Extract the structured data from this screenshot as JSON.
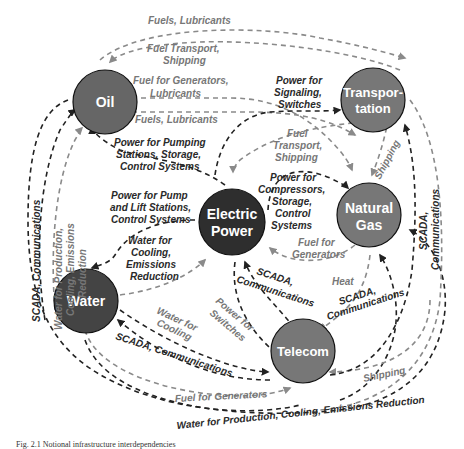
{
  "nodes": {
    "oil": {
      "label": "Oil",
      "color": "#666666"
    },
    "transportation": {
      "label1": "Transpor-",
      "label2": "tation",
      "color": "#777777"
    },
    "electric_power": {
      "label1": "Electric",
      "label2": "Power",
      "color": "#2e2e2e"
    },
    "natural_gas": {
      "label1": "Natural",
      "label2": "Gas",
      "color": "#777777"
    },
    "water": {
      "label": "Water",
      "color": "#444444"
    },
    "telecom": {
      "label": "Telecom",
      "color": "#777777"
    }
  },
  "edges": {
    "fuels_lubricants_top": "Fuels, Lubricants",
    "fuel_transport_shipping_top_1": "Fuel Transport,",
    "fuel_transport_shipping_top_2": "Shipping",
    "fuel_for_generators_lubricants_1": "Fuel for Generators,",
    "fuel_for_generators_lubricants_2": "Lubricants",
    "fuels_lubricants_mid": "Fuels, Lubricants",
    "power_for_signaling_1": "Power for",
    "power_for_signaling_2": "Signaling,",
    "power_for_signaling_3": "Switches",
    "power_pumping_1": "Power for Pumping",
    "power_pumping_2": "Stations, Storage,",
    "power_pumping_3": "Control Systems",
    "fuel_transport_mid_1": "Fuel",
    "fuel_transport_mid_2": "Transport,",
    "fuel_transport_mid_3": "Shipping",
    "shipping_trans_gas": "Shipping",
    "power_pump_lift_1": "Power for Pump",
    "power_pump_lift_2": "and Lift Stations,",
    "power_pump_lift_3": "Control Systems",
    "power_compressors_1": "Power for",
    "power_compressors_2": "Compressors,",
    "power_compressors_3": "Storage,",
    "power_compressors_4": "Control",
    "power_compressors_5": "Systems",
    "water_cooling_emissions_1": "Water for",
    "water_cooling_emissions_2": "Cooling,",
    "water_cooling_emissions_3": "Emissions",
    "water_cooling_emissions_4": "Reduction",
    "fuel_for_generators_gas_1": "Fuel for",
    "fuel_for_generators_gas_2": "Generators",
    "scada_left_vertical": "SCADA, Communications",
    "water_production_left_1": "Water for Production,",
    "water_production_left_2": "Cooling, Emissions",
    "water_production_left_3": "Reduction",
    "scada_right_vertical_1": "SCADA,",
    "scada_right_vertical_2": "Communications",
    "scada_telecom_power_1": "SCADA,",
    "scada_telecom_power_2": "Communications",
    "heat": "Heat",
    "scada_telecom_gas_1": "SCADA,",
    "scada_telecom_gas_2": "Communications",
    "water_for_cooling_1": "Water for",
    "water_for_cooling_2": "Cooling",
    "power_for_switches_1": "Power for",
    "power_for_switches_2": "Switches",
    "scada_water_telecom": "SCADA, Communications",
    "shipping_telecom": "Shipping",
    "fuel_for_generators_bottom": "Fuel for Generators",
    "water_production_bottom": "Water for Production, Cooling,  Emissions Reduction"
  },
  "caption": "Fig. 2.1 Notional infrastructure interdependencies"
}
